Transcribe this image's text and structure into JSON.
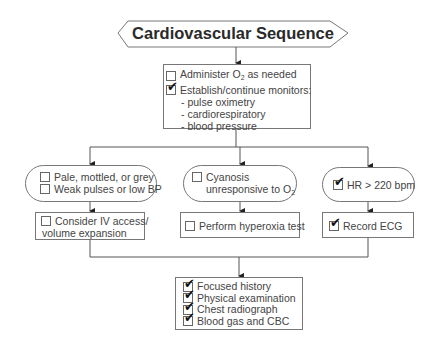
{
  "title": "Cardiovascular Sequence",
  "top_box": {
    "items": [
      {
        "label": "Administer O",
        "sub": "2",
        "after": " as needed",
        "checked": false
      },
      {
        "label": "Establish/continue monitors:",
        "checked": true
      }
    ],
    "bullets": [
      "- pulse oximetry",
      "- cardiorespiratory",
      "- blood pressure"
    ]
  },
  "branches": [
    {
      "condition": {
        "items": [
          {
            "label": "Pale, mottled, or grey",
            "checked": false
          },
          {
            "label": "Weak pulses or low BP",
            "checked": false
          }
        ]
      },
      "action": {
        "lines": [
          "Consider IV access/",
          "volume expansion"
        ],
        "checked": false
      }
    },
    {
      "condition": {
        "items": [
          {
            "label": "Cyanosis",
            "line2": "unresponsive to O",
            "sub": "2",
            "checked": false
          }
        ]
      },
      "action": {
        "lines": [
          "Perform hyperoxia test"
        ],
        "checked": false
      }
    },
    {
      "condition": {
        "items": [
          {
            "label": "HR > 220 bpm",
            "checked": true
          }
        ]
      },
      "action": {
        "lines": [
          "Record ECG"
        ],
        "checked": true
      }
    }
  ],
  "bottom_box": {
    "items": [
      {
        "label": "Focused history",
        "checked": true
      },
      {
        "label": "Physical examination",
        "checked": true
      },
      {
        "label": "Chest radiograph",
        "checked": true
      },
      {
        "label": "Blood gas and CBC",
        "checked": true
      }
    ]
  }
}
